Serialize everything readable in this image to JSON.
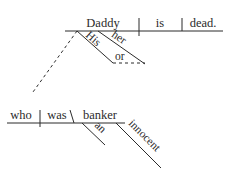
{
  "diagram": {
    "type": "sentence-diagram",
    "main_clause": {
      "subject": "Daddy",
      "verb": "is",
      "predicate_adjective": "dead.",
      "modifiers": {
        "his": "His",
        "her": "her",
        "conjunction": "or"
      }
    },
    "relative_clause": {
      "subject": "who",
      "verb": "was",
      "predicate_nominative": "banker",
      "modifiers": {
        "article": "an",
        "adjective": "innocent"
      }
    }
  }
}
